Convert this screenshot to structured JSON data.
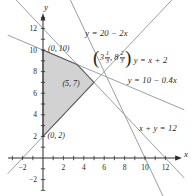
{
  "chart_data": {
    "type": "line",
    "axes": {
      "x_label": "x",
      "y_label": "y",
      "x_tick_label_values": [
        -2,
        2,
        4,
        6,
        8,
        10,
        12
      ],
      "y_tick_label_values": [
        12,
        10,
        8,
        6,
        4,
        2,
        -2
      ],
      "minor_tick_step": 1,
      "tick_range": [
        -3,
        13
      ],
      "grid": false
    },
    "lines": [
      {
        "equation": "y = x + 2",
        "slope": 1,
        "intercept": 2
      },
      {
        "equation": "y = 20 − 2x",
        "slope": -2,
        "intercept": 20
      },
      {
        "equation": "y = 10 − 0.4x",
        "slope": -0.4,
        "intercept": 10
      },
      {
        "equation": "x + y = 12",
        "slope": -1,
        "intercept": 12
      }
    ],
    "region": {
      "vertices": [
        [
          0,
          2
        ],
        [
          0,
          10
        ],
        [
          3.3333,
          8.6667
        ],
        [
          5,
          7
        ]
      ],
      "vertex_names": [
        "(0, 2)",
        "(0, 10)",
        "(3 1/3, 8 2/3)",
        "(5, 7)"
      ]
    },
    "labels": [
      {
        "text": "y = 20 − 2x",
        "x": 4.15,
        "y": 11.6,
        "kind": "equation"
      },
      {
        "text": "y = x + 2",
        "x": 8.9,
        "y": 9.1,
        "kind": "equation"
      },
      {
        "text": "y = 10 − 0.4x",
        "x": 8.3,
        "y": 7.25,
        "kind": "equation"
      },
      {
        "text": "x + y = 12",
        "x": 9.4,
        "y": 2.75,
        "kind": "equation"
      },
      {
        "text": "(0, 10)",
        "x": 0.5,
        "y": 10.2,
        "kind": "point"
      },
      {
        "text": "(5, 7)",
        "x": 1.9,
        "y": 6.95,
        "kind": "point"
      },
      {
        "text": "(0, 2)",
        "x": 0.45,
        "y": 2.1,
        "kind": "point"
      }
    ],
    "vertex_fraction_label": {
      "open": "(",
      "first_whole": "3",
      "first_num": "1",
      "first_den": "3",
      "separator": ",",
      "second_whole": "8",
      "second_num": "2",
      "second_den": "3",
      "close": ")",
      "x": 4.85,
      "y": 9.25
    },
    "colors": {
      "background": "#ffffff",
      "constraint_line": "#9aa0a4",
      "region_fill": "#d2d2d2",
      "region_stroke": "#5d6165",
      "axis": "#2e2e2e",
      "text": "#1f1f1f"
    },
    "layout": {
      "origin_px": [
        43,
        158
      ],
      "unit_px": [
        10.2,
        10.8
      ],
      "x_axis_px": [
        8,
        177,
        182
      ],
      "y_axis_px": [
        190,
        19,
        13
      ],
      "x_draw_range": [
        -3.45,
        13.85
      ]
    }
  }
}
